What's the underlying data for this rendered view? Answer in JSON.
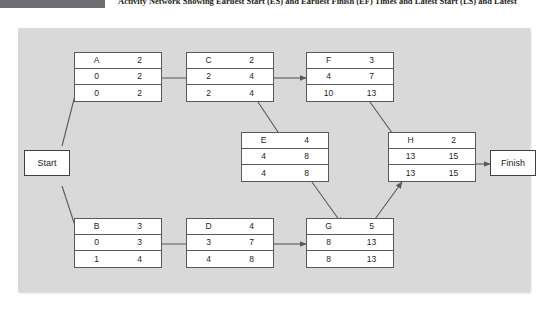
{
  "header": {
    "title": "Activity Network Showing Earliest Start (ES) and Earliest Finish (EF) Times and Latest Start (LS) and Latest Finish (LF) Times",
    "bar_color": "#6d6e71"
  },
  "diagram": {
    "background_color": "#d9d9d9",
    "node_fill": "#ffffff",
    "node_border": "#58595b",
    "arrow_color": "#58595b",
    "type": "activity-on-node-network",
    "terminals": {
      "start": "Start",
      "finish": "Finish"
    },
    "nodes": [
      {
        "id": "A",
        "label": "A",
        "duration": "2",
        "es": "0",
        "ef": "2",
        "ls": "0",
        "lf": "2"
      },
      {
        "id": "C",
        "label": "C",
        "duration": "2",
        "es": "2",
        "ef": "4",
        "ls": "2",
        "lf": "4"
      },
      {
        "id": "F",
        "label": "F",
        "duration": "3",
        "es": "4",
        "ef": "7",
        "ls": "10",
        "lf": "13"
      },
      {
        "id": "E",
        "label": "E",
        "duration": "4",
        "es": "4",
        "ef": "8",
        "ls": "4",
        "lf": "8"
      },
      {
        "id": "H",
        "label": "H",
        "duration": "2",
        "es": "13",
        "ef": "15",
        "ls": "13",
        "lf": "15"
      },
      {
        "id": "B",
        "label": "B",
        "duration": "3",
        "es": "0",
        "ef": "3",
        "ls": "1",
        "lf": "4"
      },
      {
        "id": "D",
        "label": "D",
        "duration": "4",
        "es": "3",
        "ef": "7",
        "ls": "4",
        "lf": "8"
      },
      {
        "id": "G",
        "label": "G",
        "duration": "5",
        "es": "8",
        "ef": "13",
        "ls": "8",
        "lf": "13"
      }
    ],
    "edges": [
      {
        "from": "Start",
        "to": "A"
      },
      {
        "from": "Start",
        "to": "B"
      },
      {
        "from": "A",
        "to": "C"
      },
      {
        "from": "C",
        "to": "F"
      },
      {
        "from": "C",
        "to": "E"
      },
      {
        "from": "F",
        "to": "H"
      },
      {
        "from": "E",
        "to": "G"
      },
      {
        "from": "B",
        "to": "D"
      },
      {
        "from": "D",
        "to": "G"
      },
      {
        "from": "G",
        "to": "H"
      },
      {
        "from": "H",
        "to": "Finish"
      }
    ]
  }
}
